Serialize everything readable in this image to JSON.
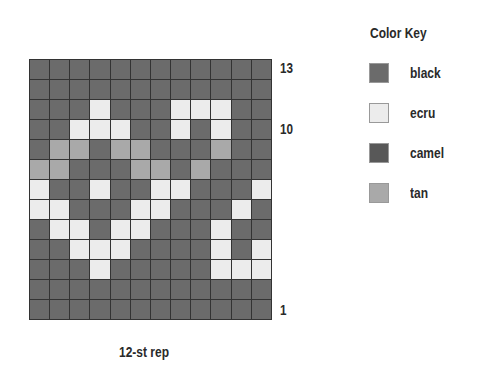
{
  "chart": {
    "columns": 12,
    "rows": 13,
    "row_labels": [
      {
        "text": "13",
        "row": 13
      },
      {
        "text": "10",
        "row": 10
      },
      {
        "text": "1",
        "row": 1
      }
    ],
    "caption": "12-st rep",
    "grid_top_to_bottom": [
      [
        "B",
        "B",
        "B",
        "B",
        "B",
        "B",
        "B",
        "B",
        "B",
        "B",
        "B",
        "B"
      ],
      [
        "B",
        "B",
        "B",
        "B",
        "B",
        "B",
        "B",
        "B",
        "B",
        "B",
        "B",
        "B"
      ],
      [
        "B",
        "B",
        "B",
        "E",
        "B",
        "B",
        "B",
        "E",
        "E",
        "E",
        "B",
        "B"
      ],
      [
        "B",
        "B",
        "E",
        "E",
        "E",
        "B",
        "B",
        "E",
        "B",
        "E",
        "B",
        "B"
      ],
      [
        "B",
        "T",
        "T",
        "B",
        "T",
        "T",
        "B",
        "B",
        "B",
        "T",
        "B",
        "B"
      ],
      [
        "T",
        "T",
        "B",
        "B",
        "B",
        "T",
        "T",
        "B",
        "T",
        "B",
        "B",
        "B"
      ],
      [
        "E",
        "B",
        "B",
        "E",
        "B",
        "B",
        "E",
        "E",
        "B",
        "B",
        "B",
        "E"
      ],
      [
        "E",
        "E",
        "B",
        "B",
        "B",
        "E",
        "E",
        "B",
        "B",
        "B",
        "E",
        "B"
      ],
      [
        "B",
        "E",
        "E",
        "B",
        "E",
        "E",
        "B",
        "B",
        "B",
        "E",
        "B",
        "B"
      ],
      [
        "B",
        "B",
        "E",
        "E",
        "E",
        "B",
        "B",
        "B",
        "B",
        "E",
        "B",
        "E"
      ],
      [
        "B",
        "B",
        "B",
        "E",
        "B",
        "B",
        "B",
        "B",
        "B",
        "E",
        "E",
        "E"
      ],
      [
        "B",
        "B",
        "B",
        "B",
        "B",
        "B",
        "B",
        "B",
        "B",
        "B",
        "B",
        "B"
      ],
      [
        "B",
        "B",
        "B",
        "B",
        "B",
        "B",
        "B",
        "B",
        "B",
        "B",
        "B",
        "B"
      ]
    ]
  },
  "key": {
    "title": "Color Key",
    "items": [
      {
        "code": "B",
        "label": "black",
        "color": "#6b6b6b"
      },
      {
        "code": "E",
        "label": "ecru",
        "color": "#ececec"
      },
      {
        "code": "C",
        "label": "camel",
        "color": "#585858"
      },
      {
        "code": "T",
        "label": "tan",
        "color": "#a9a9a9"
      }
    ]
  }
}
